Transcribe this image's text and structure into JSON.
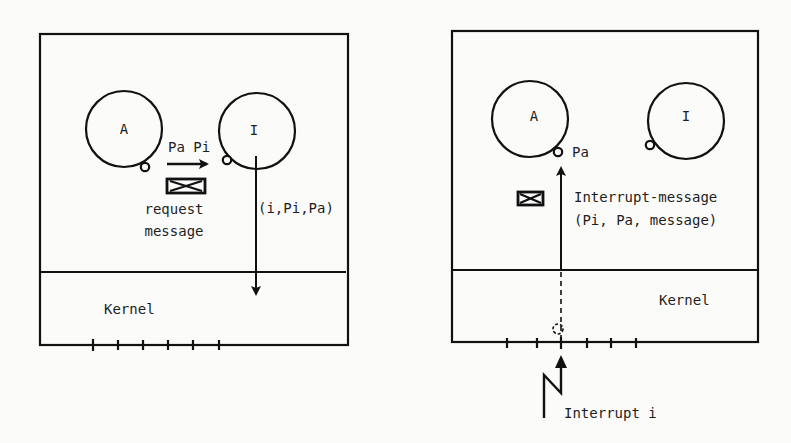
{
  "left_panel": {
    "process_a": {
      "label": "A"
    },
    "process_i": {
      "label": "I"
    },
    "send_label": "Pa Pi",
    "request_label_line1": "request",
    "request_label_line2": "message",
    "kernel_call_label": "(i,Pi,Pa)",
    "kernel_label": "Kernel",
    "tick_count": 6
  },
  "right_panel": {
    "process_a": {
      "label": "A"
    },
    "process_i": {
      "label": "I"
    },
    "port_label": "Pa",
    "message_label_line1": "Interrupt-message",
    "message_label_line2": "(Pi, Pa, message)",
    "kernel_label": "Kernel",
    "interrupt_label": "Interrupt i",
    "tick_count": 6
  },
  "colors": {
    "ink": "#111111",
    "paper": "#fbfbfa"
  }
}
